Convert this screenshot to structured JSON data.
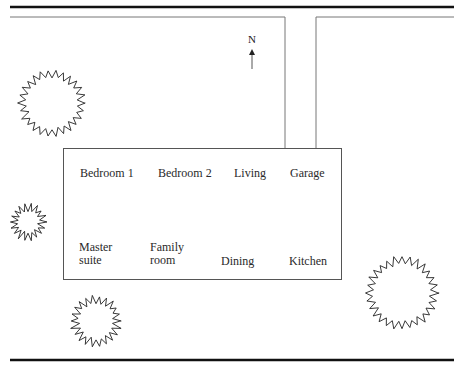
{
  "diagram": {
    "type": "site-plan",
    "compass": {
      "label": "N",
      "direction": "up"
    },
    "house": {
      "rooms_top_row": [
        {
          "id": "bedroom-1",
          "label": "Bedroom 1"
        },
        {
          "id": "bedroom-2",
          "label": "Bedroom 2"
        },
        {
          "id": "living",
          "label": "Living"
        },
        {
          "id": "garage",
          "label": "Garage"
        }
      ],
      "rooms_bottom_row": [
        {
          "id": "master-suite",
          "label": "Master\nsuite"
        },
        {
          "id": "family-room",
          "label": "Family\nroom"
        },
        {
          "id": "dining",
          "label": "Dining"
        },
        {
          "id": "kitchen",
          "label": "Kitchen"
        }
      ]
    },
    "driveway": {
      "leads_to": "Garage"
    },
    "trees": [
      {
        "id": "tree-northwest",
        "size": "large"
      },
      {
        "id": "tree-west",
        "size": "small"
      },
      {
        "id": "tree-southwest",
        "size": "medium"
      },
      {
        "id": "tree-southeast",
        "size": "large"
      }
    ],
    "colors": {
      "line": "#333333",
      "background": "#ffffff"
    }
  }
}
